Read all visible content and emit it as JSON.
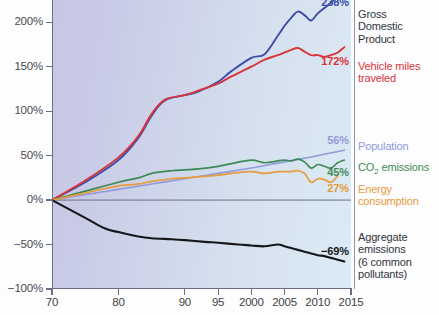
{
  "chart_data": {
    "type": "line",
    "title": "",
    "subtitle": "",
    "xlabel": "",
    "ylabel": "",
    "xlim": [
      1970,
      2015
    ],
    "ylim": [
      -100,
      225
    ],
    "grid": false,
    "legend_position": "right",
    "y_ticks": [
      200,
      150,
      100,
      50,
      0,
      -50,
      -100
    ],
    "y_tick_labels": [
      "200%",
      "150%",
      "100%",
      "50%",
      "0%",
      "−50%",
      "−100%"
    ],
    "x_ticks": [
      1970,
      1980,
      1990,
      1995,
      2000,
      2005,
      2010,
      2015
    ],
    "x_tick_labels": [
      "70",
      "80",
      "90",
      "95",
      "2000",
      "2005",
      "2010",
      "2015"
    ],
    "baseline_value": 0,
    "series": [
      {
        "name": "Gross Domestic Product",
        "legend_label": "Gross\nDomestic\nProduct",
        "color": "#3b4da8",
        "end_label": "238%",
        "end_value": 238,
        "x": [
          1970,
          1975,
          1980,
          1983,
          1985,
          1987,
          1990,
          1992,
          1995,
          1997,
          2000,
          2002,
          2004,
          2005,
          2006,
          2007,
          2008,
          2009,
          2010,
          2011,
          2012,
          2013,
          2014
        ],
        "values": [
          0,
          20,
          45,
          70,
          95,
          112,
          118,
          122,
          133,
          145,
          160,
          164,
          185,
          196,
          205,
          212,
          208,
          202,
          210,
          216,
          222,
          229,
          238
        ]
      },
      {
        "name": "Vehicle miles traveled",
        "legend_label": "Vehicle miles\ntraveled",
        "color": "#d8343a",
        "end_label": "172%",
        "end_value": 172,
        "x": [
          1970,
          1975,
          1980,
          1983,
          1985,
          1987,
          1990,
          1992,
          1995,
          1997,
          2000,
          2002,
          2004,
          2005,
          2006,
          2007,
          2008,
          2009,
          2010,
          2011,
          2012,
          2013,
          2014
        ],
        "values": [
          0,
          22,
          48,
          72,
          97,
          113,
          118,
          123,
          131,
          139,
          150,
          158,
          163,
          166,
          169,
          171,
          167,
          163,
          163,
          161,
          163,
          166,
          172
        ]
      },
      {
        "name": "Population",
        "legend_label": "Population",
        "color": "#8f9bdb",
        "end_label": "56%",
        "end_value": 56,
        "x": [
          1970,
          1975,
          1980,
          1985,
          1990,
          1995,
          2000,
          2005,
          2010,
          2014
        ],
        "values": [
          0,
          6,
          12,
          18,
          24,
          30,
          36,
          43,
          50,
          56
        ]
      },
      {
        "name": "CO2 emissions",
        "legend_label": "CO₂ emissions",
        "color": "#3d8a55",
        "end_label": "45%",
        "end_value": 45,
        "x": [
          1970,
          1975,
          1980,
          1983,
          1985,
          1988,
          1990,
          1992,
          1995,
          1997,
          2000,
          2002,
          2004,
          2005,
          2006,
          2007,
          2008,
          2009,
          2010,
          2011,
          2012,
          2013,
          2014
        ],
        "values": [
          0,
          10,
          20,
          25,
          30,
          33,
          34,
          35,
          38,
          41,
          45,
          42,
          44,
          45,
          44,
          46,
          43,
          36,
          40,
          38,
          36,
          42,
          45
        ]
      },
      {
        "name": "Energy consumption",
        "legend_label": "Energy\nconsumption",
        "color": "#e89b3c",
        "end_label": "27%",
        "end_value": 27,
        "x": [
          1970,
          1975,
          1980,
          1983,
          1985,
          1988,
          1990,
          1992,
          1995,
          1997,
          2000,
          2002,
          2004,
          2005,
          2006,
          2007,
          2008,
          2009,
          2010,
          2011,
          2012,
          2013
        ],
        "values": [
          0,
          8,
          16,
          18,
          21,
          24,
          25,
          26,
          28,
          30,
          32,
          30,
          32,
          32,
          32,
          33,
          30,
          20,
          24,
          23,
          20,
          27
        ]
      },
      {
        "name": "Aggregate emissions (6 common pollutants)",
        "legend_label": "Aggregate\nemissions\n(6 common\npollutants)",
        "color": "#15161c",
        "end_label": "−69%",
        "end_value": -69,
        "x": [
          1970,
          1975,
          1978,
          1980,
          1983,
          1985,
          1988,
          1990,
          1993,
          1995,
          1998,
          2000,
          2002,
          2004,
          2005,
          2006,
          2007,
          2008,
          2009,
          2010,
          2011,
          2012,
          2013,
          2014
        ],
        "values": [
          0,
          -20,
          -32,
          -36,
          -41,
          -43,
          -44,
          -45,
          -47,
          -48,
          -50,
          -51,
          -52,
          -50,
          -52,
          -54,
          -56,
          -58,
          -60,
          -62,
          -63,
          -65,
          -67,
          -69
        ]
      }
    ]
  },
  "axis": {
    "y_labels": [
      "200%",
      "150%",
      "100%",
      "50%",
      "0%",
      "−50%",
      "−100%"
    ],
    "x_labels": [
      "70",
      "80",
      "90",
      "95",
      "2000",
      "2005",
      "2010",
      "2015"
    ]
  },
  "value_labels": {
    "gdp": "238%",
    "vmt": "172%",
    "population": "56%",
    "co2": "45%",
    "energy": "27%",
    "aggregate": "−69%"
  },
  "legend": {
    "gdp": "Gross\nDomestic\nProduct",
    "vmt": "Vehicle miles\ntraveled",
    "population": "Population",
    "co2_prefix": "CO",
    "co2_sub": "2",
    "co2_suffix": " emissions",
    "energy": "Energy\nconsumption",
    "aggregate": "Aggregate\nemissions\n(6 common\npollutants)"
  },
  "colors": {
    "gdp": "#3b4da8",
    "vmt": "#d8343a",
    "population": "#8f9bdb",
    "co2": "#3d8a55",
    "energy": "#e89b3c",
    "aggregate": "#15161c",
    "axis": "#6b6f86",
    "baseline": "#6b7088"
  }
}
